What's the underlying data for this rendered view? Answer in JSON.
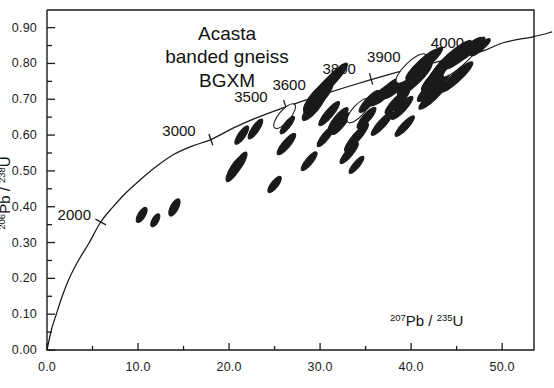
{
  "figure": {
    "annotation_lines": [
      "Acasta",
      "banded gneiss",
      "BGXM"
    ],
    "y_axis_title_parts": {
      "sup1": "206",
      "mid": "Pb / ",
      "sup2": "238",
      "end": "U"
    },
    "x_axis_title_parts": {
      "sup1": "207",
      "mid": "Pb / ",
      "sup2": "235",
      "end": "U"
    }
  },
  "chart_data": {
    "type": "scatter",
    "title": "Acasta banded gneiss BGXM",
    "xlabel": "207Pb / 235U",
    "ylabel": "206Pb / 238U",
    "xlim": [
      0.0,
      55.0
    ],
    "ylim": [
      0.0,
      0.92
    ],
    "grid": false,
    "legend": "none",
    "x_ticks_major": [
      "0.0",
      "10.0",
      "20.0",
      "30.0",
      "40.0",
      "50.0"
    ],
    "x_tick_values_major": [
      0,
      10,
      20,
      30,
      40,
      50
    ],
    "x_tick_values_minor": [
      5,
      15,
      25,
      35,
      45
    ],
    "y_ticks_major": [
      "0.00",
      "0.10",
      "0.20",
      "0.30",
      "0.40",
      "0.50",
      "0.60",
      "0.70",
      "0.80",
      "0.90"
    ],
    "y_tick_values_major": [
      0.0,
      0.1,
      0.2,
      0.3,
      0.4,
      0.5,
      0.6,
      0.7,
      0.8,
      0.9
    ],
    "y_tick_values_minor": [
      0.05,
      0.15,
      0.25,
      0.35,
      0.45,
      0.55,
      0.65,
      0.75,
      0.85
    ],
    "concordia": {
      "name": "Concordia curve",
      "points": [
        [
          0.0,
          0.0
        ],
        [
          0.5,
          0.058
        ],
        [
          1.0,
          0.098
        ],
        [
          1.7,
          0.152
        ],
        [
          2.5,
          0.203
        ],
        [
          3.5,
          0.252
        ],
        [
          4.6,
          0.298
        ],
        [
          5.9,
          0.3573
        ],
        [
          7.2,
          0.398
        ],
        [
          8.6,
          0.437
        ],
        [
          10.2,
          0.474
        ],
        [
          12.0,
          0.512
        ],
        [
          14.0,
          0.547
        ],
        [
          16.0,
          0.57
        ],
        [
          18.0,
          0.5873
        ],
        [
          20.5,
          0.62
        ],
        [
          23.0,
          0.648
        ],
        [
          25.5,
          0.672
        ],
        [
          28.0,
          0.694
        ],
        [
          30.5,
          0.715
        ],
        [
          33.0,
          0.735
        ],
        [
          35.5,
          0.754
        ],
        [
          38.0,
          0.772
        ],
        [
          40.5,
          0.789
        ],
        [
          43.0,
          0.805
        ],
        [
          45.5,
          0.82
        ],
        [
          48.0,
          0.836
        ],
        [
          50.2,
          0.8584
        ],
        [
          53.5,
          0.875
        ],
        [
          55.5,
          0.888
        ]
      ]
    },
    "age_ticks": [
      {
        "age": 2000,
        "x": 5.9,
        "y": 0.3573,
        "label_dx": -2.9,
        "label_dy": 0.023
      },
      {
        "age": 3000,
        "x": 18.0,
        "y": 0.5873,
        "label_dx": -3.5,
        "label_dy": 0.028
      },
      {
        "age": 3500,
        "x": 26.2,
        "y": 0.682,
        "label_dx": -3.8,
        "label_dy": 0.027
      },
      {
        "age": 3600,
        "x": 30.0,
        "y": 0.713,
        "label_dx": -3.4,
        "label_dy": 0.031
      },
      {
        "age": 3800,
        "x": 35.6,
        "y": 0.757,
        "label_dx": -3.5,
        "label_dy": 0.03
      },
      {
        "age": 3900,
        "x": 40.6,
        "y": 0.791,
        "label_dx": -3.6,
        "label_dy": 0.03
      },
      {
        "age": 4000,
        "x": 46.0,
        "y": 0.826,
        "label_dx": -2.0,
        "label_dy": 0.033
      }
    ],
    "ellipses": [
      {
        "cx": 10.4,
        "cy": 0.377,
        "rx": 0.95,
        "ry": 0.01,
        "rot": -58,
        "fill": "solid"
      },
      {
        "cx": 11.9,
        "cy": 0.362,
        "rx": 0.8,
        "ry": 0.009,
        "rot": -60,
        "fill": "solid"
      },
      {
        "cx": 14.0,
        "cy": 0.398,
        "rx": 1.05,
        "ry": 0.011,
        "rot": -62,
        "fill": "solid"
      },
      {
        "cx": 20.6,
        "cy": 0.505,
        "rx": 1.6,
        "ry": 0.012,
        "rot": -58,
        "fill": "solid"
      },
      {
        "cx": 21.1,
        "cy": 0.52,
        "rx": 1.5,
        "ry": 0.011,
        "rot": -58,
        "fill": "solid"
      },
      {
        "cx": 21.4,
        "cy": 0.6,
        "rx": 1.2,
        "ry": 0.01,
        "rot": -55,
        "fill": "solid"
      },
      {
        "cx": 22.9,
        "cy": 0.617,
        "rx": 1.3,
        "ry": 0.01,
        "rot": -56,
        "fill": "solid"
      },
      {
        "cx": 26.1,
        "cy": 0.653,
        "rx": 1.7,
        "ry": 0.016,
        "rot": -50,
        "fill": "open"
      },
      {
        "cx": 26.4,
        "cy": 0.628,
        "rx": 1.2,
        "ry": 0.009,
        "rot": -52,
        "fill": "solid"
      },
      {
        "cx": 26.3,
        "cy": 0.575,
        "rx": 1.5,
        "ry": 0.011,
        "rot": -50,
        "fill": "solid"
      },
      {
        "cx": 25.0,
        "cy": 0.462,
        "rx": 1.1,
        "ry": 0.01,
        "rot": -52,
        "fill": "solid"
      },
      {
        "cx": 29.3,
        "cy": 0.678,
        "rx": 1.85,
        "ry": 0.014,
        "rot": -50,
        "fill": "solid"
      },
      {
        "cx": 29.8,
        "cy": 0.707,
        "rx": 2.3,
        "ry": 0.019,
        "rot": -48,
        "fill": "solid"
      },
      {
        "cx": 29.9,
        "cy": 0.714,
        "rx": 2.0,
        "ry": 0.013,
        "rot": -48,
        "fill": "solid"
      },
      {
        "cx": 30.4,
        "cy": 0.733,
        "rx": 2.1,
        "ry": 0.012,
        "rot": -48,
        "fill": "solid"
      },
      {
        "cx": 31.2,
        "cy": 0.752,
        "rx": 2.6,
        "ry": 0.013,
        "rot": -47,
        "fill": "solid"
      },
      {
        "cx": 31.0,
        "cy": 0.66,
        "rx": 1.7,
        "ry": 0.011,
        "rot": -50,
        "fill": "solid"
      },
      {
        "cx": 32.0,
        "cy": 0.645,
        "rx": 1.6,
        "ry": 0.011,
        "rot": -50,
        "fill": "solid"
      },
      {
        "cx": 32.3,
        "cy": 0.632,
        "rx": 1.5,
        "ry": 0.01,
        "rot": -51,
        "fill": "solid"
      },
      {
        "cx": 30.6,
        "cy": 0.596,
        "rx": 1.4,
        "ry": 0.01,
        "rot": -52,
        "fill": "solid"
      },
      {
        "cx": 34.0,
        "cy": 0.594,
        "rx": 2.0,
        "ry": 0.011,
        "rot": -50,
        "fill": "solid"
      },
      {
        "cx": 34.2,
        "cy": 0.668,
        "rx": 1.7,
        "ry": 0.016,
        "rot": -48,
        "fill": "open"
      },
      {
        "cx": 35.4,
        "cy": 0.694,
        "rx": 1.6,
        "ry": 0.011,
        "rot": -48,
        "fill": "solid"
      },
      {
        "cx": 35.1,
        "cy": 0.648,
        "rx": 1.5,
        "ry": 0.011,
        "rot": -49,
        "fill": "solid"
      },
      {
        "cx": 36.6,
        "cy": 0.71,
        "rx": 1.5,
        "ry": 0.011,
        "rot": -47,
        "fill": "solid"
      },
      {
        "cx": 37.3,
        "cy": 0.722,
        "rx": 1.9,
        "ry": 0.012,
        "rot": -46,
        "fill": "solid"
      },
      {
        "cx": 38.6,
        "cy": 0.743,
        "rx": 2.2,
        "ry": 0.014,
        "rot": -45,
        "fill": "solid"
      },
      {
        "cx": 38.5,
        "cy": 0.694,
        "rx": 1.9,
        "ry": 0.012,
        "rot": -46,
        "fill": "solid"
      },
      {
        "cx": 39.0,
        "cy": 0.676,
        "rx": 1.7,
        "ry": 0.011,
        "rot": -47,
        "fill": "solid"
      },
      {
        "cx": 40.4,
        "cy": 0.757,
        "rx": 2.6,
        "ry": 0.016,
        "rot": -44,
        "fill": "solid"
      },
      {
        "cx": 40.0,
        "cy": 0.786,
        "rx": 2.2,
        "ry": 0.018,
        "rot": -44,
        "fill": "open"
      },
      {
        "cx": 41.2,
        "cy": 0.797,
        "rx": 2.4,
        "ry": 0.013,
        "rot": -43,
        "fill": "solid"
      },
      {
        "cx": 41.9,
        "cy": 0.808,
        "rx": 2.1,
        "ry": 0.012,
        "rot": -43,
        "fill": "solid"
      },
      {
        "cx": 42.6,
        "cy": 0.741,
        "rx": 2.6,
        "ry": 0.015,
        "rot": -44,
        "fill": "solid"
      },
      {
        "cx": 43.3,
        "cy": 0.774,
        "rx": 2.9,
        "ry": 0.017,
        "rot": -43,
        "fill": "solid"
      },
      {
        "cx": 43.6,
        "cy": 0.786,
        "rx": 2.7,
        "ry": 0.013,
        "rot": -43,
        "fill": "solid"
      },
      {
        "cx": 43.9,
        "cy": 0.801,
        "rx": 2.5,
        "ry": 0.012,
        "rot": -42,
        "fill": "solid"
      },
      {
        "cx": 44.4,
        "cy": 0.816,
        "rx": 2.7,
        "ry": 0.013,
        "rot": -42,
        "fill": "solid"
      },
      {
        "cx": 44.8,
        "cy": 0.823,
        "rx": 2.4,
        "ry": 0.011,
        "rot": -42,
        "fill": "solid"
      },
      {
        "cx": 45.4,
        "cy": 0.806,
        "rx": 2.5,
        "ry": 0.013,
        "rot": -42,
        "fill": "open"
      },
      {
        "cx": 45.8,
        "cy": 0.829,
        "rx": 2.6,
        "ry": 0.012,
        "rot": -41,
        "fill": "solid"
      },
      {
        "cx": 46.5,
        "cy": 0.838,
        "rx": 2.1,
        "ry": 0.01,
        "rot": -41,
        "fill": "solid"
      },
      {
        "cx": 45.0,
        "cy": 0.762,
        "rx": 2.4,
        "ry": 0.013,
        "rot": -43,
        "fill": "solid"
      },
      {
        "cx": 42.4,
        "cy": 0.71,
        "rx": 2.1,
        "ry": 0.012,
        "rot": -44,
        "fill": "solid"
      },
      {
        "cx": 36.8,
        "cy": 0.632,
        "rx": 1.7,
        "ry": 0.011,
        "rot": -48,
        "fill": "solid"
      },
      {
        "cx": 33.2,
        "cy": 0.55,
        "rx": 1.5,
        "ry": 0.01,
        "rot": -50,
        "fill": "solid"
      },
      {
        "cx": 28.8,
        "cy": 0.527,
        "rx": 1.3,
        "ry": 0.01,
        "rot": -51,
        "fill": "solid"
      },
      {
        "cx": 34.0,
        "cy": 0.517,
        "rx": 1.2,
        "ry": 0.009,
        "rot": -50,
        "fill": "solid"
      },
      {
        "cx": 39.3,
        "cy": 0.625,
        "rx": 1.5,
        "ry": 0.01,
        "rot": -47,
        "fill": "solid"
      },
      {
        "cx": 47.6,
        "cy": 0.845,
        "rx": 1.4,
        "ry": 0.009,
        "rot": -40,
        "fill": "solid"
      }
    ]
  },
  "axis_geometry": {
    "plot_left_px": 47,
    "plot_right_px": 534,
    "plot_top_px": 10,
    "plot_bottom_px": 350,
    "x_min": 0.0,
    "x_max": 53.5,
    "y_min": 0.0,
    "y_max": 0.9492
  }
}
